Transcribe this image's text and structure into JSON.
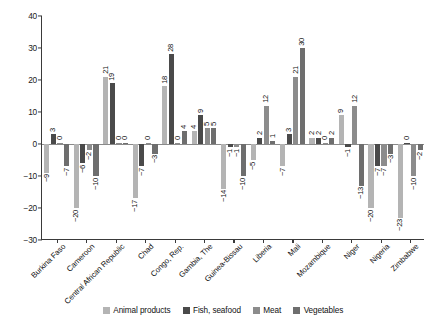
{
  "chart_data": {
    "type": "bar",
    "title": "",
    "xlabel": "",
    "ylabel": "",
    "ylim": [
      -30,
      40
    ],
    "yticks": [
      40,
      30,
      20,
      10,
      0,
      -10,
      -20,
      -30
    ],
    "grid": false,
    "legend_position": "bottom",
    "categories": [
      "Burkina Faso",
      "Cameroon",
      "Central African Republic",
      "Chad",
      "Congo, Rep.",
      "Gambia, The",
      "Guinea-Bissau",
      "Liberia",
      "Mali",
      "Mozambique",
      "Niger",
      "Nigeria",
      "Zimbabwe"
    ],
    "series": [
      {
        "name": "Animal products",
        "color": "#b4b4b4",
        "values": [
          -9,
          -20,
          21,
          -17,
          18,
          4,
          -14,
          -5,
          -7,
          2,
          9,
          -20,
          -23
        ]
      },
      {
        "name": "Fish, seafood",
        "color": "#4a4a4a",
        "values": [
          3,
          -6,
          19,
          -7,
          28,
          9,
          -1,
          2,
          3,
          2,
          -1,
          -7,
          0
        ]
      },
      {
        "name": "Meat",
        "color": "#8c8c8c",
        "values": [
          0,
          -2,
          0,
          0,
          0,
          5,
          -1,
          12,
          21,
          0,
          12,
          -7,
          -10
        ]
      },
      {
        "name": "Vegetables",
        "color": "#6e6e6e",
        "values": [
          -7,
          -10,
          0,
          -3,
          4,
          5,
          -10,
          1,
          30,
          2,
          -13,
          -3,
          -2
        ]
      }
    ]
  }
}
